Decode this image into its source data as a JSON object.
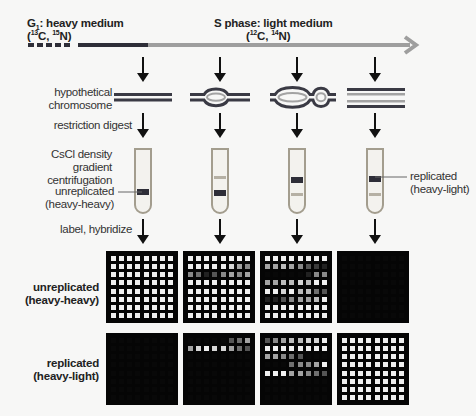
{
  "timeline": {
    "g1_label": "G",
    "g1_sub": "1",
    "g1_rest": ": heavy medium",
    "g1_isotopes_open": "(",
    "g1_c_mass": "13",
    "g1_c": "C, ",
    "g1_n_mass": "15",
    "g1_n": "N)",
    "s_label": "S phase: light medium",
    "s_isotopes_open": "(",
    "s_c_mass": "12",
    "s_c": "C, ",
    "s_n_mass": "14",
    "s_n": "N)",
    "colors": {
      "heavy": "#2e2e38",
      "light": "#9e9e9e"
    }
  },
  "steps": {
    "chromosome": [
      "hypothetical",
      "chromosome"
    ],
    "digest": "restriction digest",
    "centrifugation": [
      "CsCl density gradient",
      "centrifugation"
    ],
    "hybridize": "label, hybridize"
  },
  "tube_labels": {
    "unreplicated": [
      "unreplicated",
      "(heavy-heavy)"
    ],
    "replicated": [
      "replicated",
      "(heavy-light)"
    ]
  },
  "row_labels": {
    "unreplicated": [
      "unreplicated",
      "(heavy-heavy)"
    ],
    "replicated": [
      "replicated",
      "(heavy-light)"
    ]
  },
  "columns": [
    {
      "id": "t0",
      "chromosome": "unreplicated",
      "tube_bands": [
        "heavy"
      ]
    },
    {
      "id": "t1",
      "chromosome": "one-bubble",
      "tube_bands": [
        "light-faint",
        "heavy"
      ]
    },
    {
      "id": "t2",
      "chromosome": "two-bubbles",
      "tube_bands": [
        "heavy",
        "light-faint"
      ]
    },
    {
      "id": "t3",
      "chromosome": "fully-replicated",
      "tube_bands": [
        "heavy-light",
        "light-faint"
      ]
    }
  ],
  "grids": {
    "unreplicated": [
      [
        [
          9,
          9,
          9,
          9,
          9,
          9,
          9,
          9
        ],
        [
          9,
          9,
          9,
          9,
          9,
          9,
          9,
          9
        ],
        [
          9,
          9,
          9,
          9,
          9,
          9,
          9,
          9
        ],
        [
          9,
          9,
          9,
          9,
          9,
          9,
          9,
          9
        ],
        [
          9,
          9,
          9,
          9,
          9,
          9,
          9,
          9
        ],
        [
          9,
          9,
          9,
          9,
          9,
          9,
          9,
          9
        ],
        [
          9,
          9,
          9,
          9,
          9,
          9,
          9,
          9
        ],
        [
          9,
          9,
          9,
          9,
          9,
          9,
          9,
          9
        ]
      ],
      [
        [
          9,
          9,
          9,
          9,
          9,
          9,
          9,
          9
        ],
        [
          9,
          9,
          9,
          9,
          9,
          8,
          6,
          5
        ],
        [
          5,
          4,
          1,
          3,
          5,
          6,
          5,
          6
        ],
        [
          9,
          9,
          9,
          9,
          9,
          9,
          9,
          9
        ],
        [
          9,
          9,
          9,
          9,
          9,
          9,
          9,
          9
        ],
        [
          9,
          9,
          9,
          9,
          9,
          9,
          9,
          9
        ],
        [
          9,
          9,
          9,
          9,
          9,
          9,
          9,
          9
        ],
        [
          9,
          9,
          9,
          9,
          9,
          9,
          9,
          9
        ]
      ],
      [
        [
          9,
          9,
          9,
          9,
          9,
          9,
          9,
          9
        ],
        [
          6,
          6,
          7,
          6,
          5,
          3,
          2,
          1
        ],
        [
          0,
          0,
          0,
          0,
          0,
          1,
          5,
          5
        ],
        [
          6,
          6,
          7,
          7,
          8,
          7,
          9,
          9
        ],
        [
          9,
          9,
          8,
          9,
          7,
          7,
          4,
          3
        ],
        [
          1,
          1,
          3,
          5,
          6,
          6,
          7,
          9
        ],
        [
          9,
          9,
          9,
          9,
          9,
          9,
          9,
          9
        ],
        [
          9,
          9,
          9,
          9,
          9,
          9,
          9,
          9
        ]
      ],
      [
        [
          0,
          0,
          0,
          0,
          0,
          0,
          0,
          0
        ],
        [
          0,
          0,
          0,
          0,
          0,
          0,
          0,
          0
        ],
        [
          0,
          0,
          0,
          0,
          0,
          0,
          0,
          0
        ],
        [
          0,
          0,
          0,
          0,
          0,
          0,
          0,
          0
        ],
        [
          0,
          0,
          0,
          0,
          0,
          0,
          0,
          0
        ],
        [
          0,
          0,
          0,
          0,
          0,
          0,
          0,
          0
        ],
        [
          0,
          0,
          0,
          0,
          0,
          0,
          0,
          0
        ],
        [
          0,
          0,
          0,
          0,
          0,
          0,
          0,
          0
        ]
      ]
    ],
    "replicated": [
      [
        [
          0,
          0,
          0,
          0,
          0,
          0,
          0,
          0
        ],
        [
          0,
          0,
          0,
          0,
          0,
          0,
          0,
          0
        ],
        [
          0,
          0,
          0,
          0,
          0,
          0,
          0,
          0
        ],
        [
          0,
          0,
          0,
          0,
          0,
          0,
          0,
          0
        ],
        [
          0,
          0,
          0,
          0,
          0,
          0,
          0,
          0
        ],
        [
          0,
          0,
          0,
          0,
          0,
          0,
          0,
          0
        ],
        [
          0,
          0,
          0,
          0,
          0,
          0,
          0,
          0
        ],
        [
          0,
          0,
          0,
          0,
          0,
          0,
          0,
          0
        ]
      ],
      [
        [
          0,
          0,
          0,
          0,
          0,
          3,
          4,
          6
        ],
        [
          6,
          8,
          9,
          8,
          8,
          6,
          4,
          3
        ],
        [
          0,
          0,
          0,
          0,
          0,
          0,
          0,
          0
        ],
        [
          0,
          0,
          0,
          0,
          0,
          0,
          0,
          0
        ],
        [
          0,
          0,
          0,
          0,
          0,
          0,
          0,
          0
        ],
        [
          0,
          0,
          0,
          0,
          0,
          0,
          0,
          0
        ],
        [
          0,
          0,
          0,
          0,
          0,
          0,
          0,
          0
        ],
        [
          0,
          0,
          0,
          0,
          0,
          0,
          0,
          0
        ]
      ],
      [
        [
          3,
          5,
          6,
          7,
          7,
          8,
          8,
          9
        ],
        [
          9,
          9,
          9,
          9,
          9,
          9,
          9,
          9
        ],
        [
          6,
          6,
          5,
          4,
          3,
          0,
          0,
          0
        ],
        [
          0,
          0,
          0,
          4,
          5,
          5,
          6,
          9
        ],
        [
          9,
          9,
          9,
          6,
          6,
          5,
          4,
          3
        ],
        [
          0,
          0,
          0,
          0,
          0,
          0,
          0,
          0
        ],
        [
          0,
          0,
          0,
          0,
          0,
          0,
          0,
          0
        ],
        [
          0,
          0,
          0,
          0,
          0,
          0,
          0,
          0
        ]
      ],
      [
        [
          9,
          9,
          9,
          9,
          9,
          9,
          9,
          9
        ],
        [
          9,
          9,
          9,
          9,
          9,
          9,
          9,
          9
        ],
        [
          9,
          9,
          9,
          9,
          9,
          9,
          9,
          9
        ],
        [
          9,
          9,
          9,
          9,
          9,
          9,
          9,
          9
        ],
        [
          9,
          9,
          9,
          9,
          9,
          9,
          9,
          9
        ],
        [
          9,
          9,
          9,
          9,
          9,
          9,
          9,
          9
        ],
        [
          9,
          9,
          9,
          9,
          9,
          9,
          9,
          9
        ],
        [
          9,
          9,
          9,
          9,
          9,
          9,
          9,
          9
        ]
      ]
    ]
  }
}
